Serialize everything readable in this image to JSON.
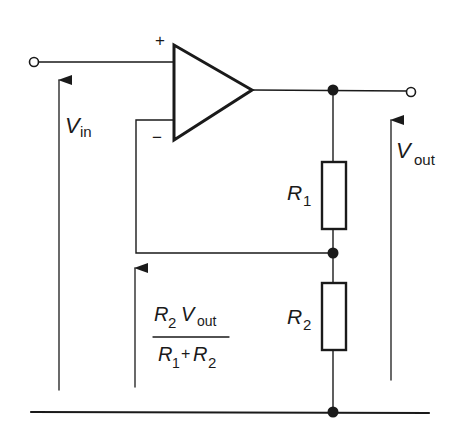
{
  "diagram": {
    "type": "circuit-schematic",
    "colors": {
      "ink": "#1a1a1a",
      "background": "#ffffff"
    },
    "opamp": {
      "plus_label": "+",
      "minus_label": "−"
    },
    "labels": {
      "vin_main": "V",
      "vin_sub": "in",
      "vout_main": "V",
      "vout_sub": "out",
      "r1_main": "R",
      "r1_sub": "1",
      "r2_main": "R",
      "r2_sub": "2",
      "fb_num_r": "R",
      "fb_num_r_sub": "2",
      "fb_num_v": "V",
      "fb_num_v_sub": "out",
      "fb_den_r1": "R",
      "fb_den_r1_sub": "1",
      "fb_den_plus": "+",
      "fb_den_r2": "R",
      "fb_den_r2_sub": "2"
    },
    "components": [
      {
        "id": "opamp",
        "kind": "operational-amplifier"
      },
      {
        "id": "R1",
        "kind": "resistor"
      },
      {
        "id": "R2",
        "kind": "resistor"
      }
    ],
    "terminals": [
      "input",
      "output",
      "ground"
    ],
    "voltages": [
      "Vin",
      "Vout",
      "R2·Vout/(R1+R2)"
    ]
  }
}
